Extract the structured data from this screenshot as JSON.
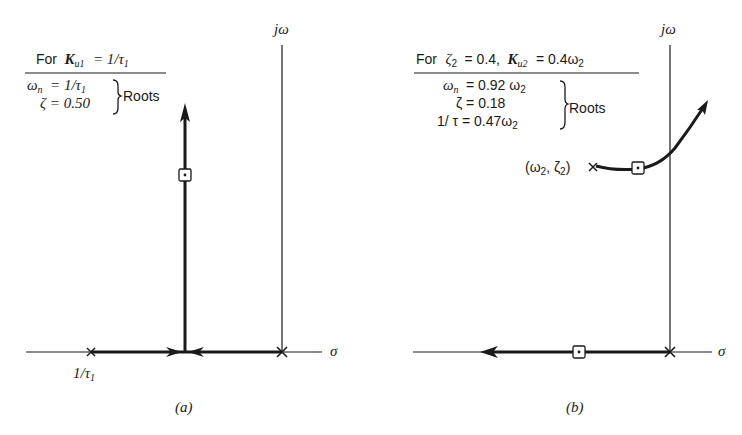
{
  "figure": {
    "panel_a": {
      "caption": "(a)",
      "header": {
        "prefix": "For",
        "K_symbol": "K",
        "K_sub": "u1",
        "rhs": "= 1/τ",
        "rhs_sub": "1"
      },
      "roots": {
        "line1_lhs": "ω",
        "line1_lhs_sub": "n",
        "line1_rhs": "= 1/τ",
        "line1_rhs_sub": "1",
        "line2": "ζ = 0.50",
        "label": "Roots"
      },
      "axes": {
        "imag_label": "jω",
        "real_label": "σ"
      },
      "pole_label": "1/τ",
      "pole_label_sub": "1"
    },
    "panel_b": {
      "caption": "(b)",
      "header": {
        "prefix": "For",
        "zeta": "ζ",
        "zeta_sub": "2",
        "zeta_val": "= 0.4,",
        "K_symbol": "K",
        "K_sub": "u2",
        "rhs": "= 0.4ω",
        "rhs_sub": "2"
      },
      "roots": {
        "line1_lhs": "ω",
        "line1_lhs_sub": "n",
        "line1_rhs": "= 0.92 ω",
        "line1_rhs_sub": "2",
        "line2": "ζ = 0.18",
        "line3_rhs": "1/ τ = 0.47ω",
        "line3_rhs_sub": "2",
        "label": "Roots"
      },
      "axes": {
        "imag_label": "jω",
        "real_label": "σ"
      },
      "pole_label": "(ω",
      "pole_label_sub": "2",
      "pole_label_mid": ", ζ",
      "pole_label_sub2": "2",
      "pole_label_end": ")"
    }
  }
}
